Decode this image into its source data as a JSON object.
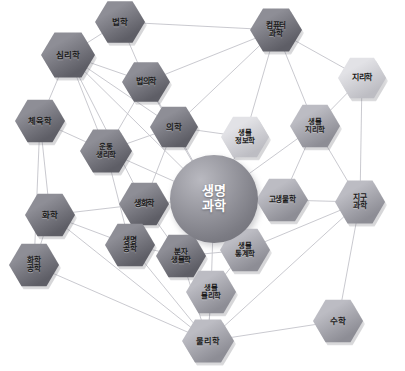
{
  "diagram": {
    "center": {
      "label_line1": "생명",
      "label_line2": "과학",
      "name": "life-science",
      "color_dark": "#7b7b83",
      "color_light": "#b9b9c0"
    },
    "caption": "",
    "palette": {
      "node_dark": "#6f6f77",
      "node_mid": "#9a9aa2",
      "node_light": "#d6d6db",
      "edge": "#c3c3c9",
      "background": "#ffffff",
      "text": "#1a1a1a",
      "center_text": "#ffffff"
    },
    "nodes": [
      {
        "id": "law",
        "lines": [
          "법학"
        ],
        "x": 120,
        "y": 22,
        "w": 50,
        "h": 44,
        "tone": "dark",
        "fs": 8.5
      },
      {
        "id": "computer-sci",
        "lines": [
          "컴퓨터",
          "과학"
        ],
        "x": 276,
        "y": 30,
        "w": 52,
        "h": 46,
        "tone": "dark",
        "fs": 7.6
      },
      {
        "id": "psychology",
        "lines": [
          "심리학"
        ],
        "x": 68,
        "y": 55,
        "w": 54,
        "h": 48,
        "tone": "dark",
        "fs": 8.5
      },
      {
        "id": "forensics",
        "lines": [
          "법의학"
        ],
        "x": 146,
        "y": 82,
        "w": 48,
        "h": 42,
        "tone": "dark",
        "fs": 8.0
      },
      {
        "id": "geography",
        "lines": [
          "지리학"
        ],
        "x": 362,
        "y": 78,
        "w": 48,
        "h": 43,
        "tone": "light",
        "fs": 8.0
      },
      {
        "id": "physical-ed",
        "lines": [
          "체육학"
        ],
        "x": 40,
        "y": 121,
        "w": 50,
        "h": 45,
        "tone": "dark",
        "fs": 8.2
      },
      {
        "id": "medicine",
        "lines": [
          "의학"
        ],
        "x": 174,
        "y": 127,
        "w": 48,
        "h": 43,
        "tone": "dark",
        "fs": 8.5
      },
      {
        "id": "bioinformatics",
        "lines": [
          "생물",
          "정보학"
        ],
        "x": 245,
        "y": 137,
        "w": 48,
        "h": 43,
        "tone": "light",
        "fs": 7.4
      },
      {
        "id": "biogeography",
        "lines": [
          "생물",
          "지리학"
        ],
        "x": 315,
        "y": 126,
        "w": 50,
        "h": 45,
        "tone": "mid",
        "fs": 7.4
      },
      {
        "id": "exercise-phys",
        "lines": [
          "운동",
          "생리학"
        ],
        "x": 106,
        "y": 151,
        "w": 52,
        "h": 46,
        "tone": "dark",
        "fs": 7.4
      },
      {
        "id": "biochemistry",
        "lines": [
          "생화학"
        ],
        "x": 144,
        "y": 204,
        "w": 50,
        "h": 45,
        "tone": "dark",
        "fs": 8.0
      },
      {
        "id": "paleontology",
        "lines": [
          "고생물학"
        ],
        "x": 282,
        "y": 200,
        "w": 52,
        "h": 45,
        "tone": "mid",
        "fs": 7.6
      },
      {
        "id": "earth-sci",
        "lines": [
          "지구",
          "과학"
        ],
        "x": 360,
        "y": 202,
        "w": 50,
        "h": 46,
        "tone": "mid",
        "fs": 7.8
      },
      {
        "id": "chemistry",
        "lines": [
          "화학"
        ],
        "x": 50,
        "y": 215,
        "w": 50,
        "h": 45,
        "tone": "dark",
        "fs": 8.5
      },
      {
        "id": "bioengineering",
        "lines": [
          "생명",
          "공학"
        ],
        "x": 130,
        "y": 245,
        "w": 50,
        "h": 45,
        "tone": "dark",
        "fs": 7.6
      },
      {
        "id": "molecular-bio",
        "lines": [
          "분자",
          "생물학"
        ],
        "x": 181,
        "y": 256,
        "w": 50,
        "h": 45,
        "tone": "dark",
        "fs": 7.4
      },
      {
        "id": "biostatistics",
        "lines": [
          "생물",
          "통계학"
        ],
        "x": 245,
        "y": 250,
        "w": 50,
        "h": 45,
        "tone": "mid",
        "fs": 7.4
      },
      {
        "id": "chem-eng",
        "lines": [
          "화학",
          "공학"
        ],
        "x": 34,
        "y": 265,
        "w": 50,
        "h": 45,
        "tone": "dark",
        "fs": 7.6
      },
      {
        "id": "biophysics",
        "lines": [
          "생물",
          "물리학"
        ],
        "x": 211,
        "y": 292,
        "w": 50,
        "h": 45,
        "tone": "mid",
        "fs": 7.4
      },
      {
        "id": "physics",
        "lines": [
          "물리학"
        ],
        "x": 208,
        "y": 341,
        "w": 52,
        "h": 46,
        "tone": "mid",
        "fs": 8.2
      },
      {
        "id": "mathematics",
        "lines": [
          "수학"
        ],
        "x": 338,
        "y": 321,
        "w": 50,
        "h": 45,
        "tone": "mid",
        "fs": 8.5
      }
    ],
    "center_pos": {
      "x": 214,
      "y": 199,
      "r": 44
    },
    "edges": [
      [
        "law",
        "psychology"
      ],
      [
        "law",
        "forensics"
      ],
      [
        "law",
        "computer-sci"
      ],
      [
        "computer-sci",
        "geography"
      ],
      [
        "computer-sci",
        "bioinformatics"
      ],
      [
        "computer-sci",
        "biogeography"
      ],
      [
        "computer-sci",
        "forensics"
      ],
      [
        "computer-sci",
        "medicine"
      ],
      [
        "psychology",
        "physical-ed"
      ],
      [
        "psychology",
        "exercise-phys"
      ],
      [
        "psychology",
        "medicine"
      ],
      [
        "psychology",
        "biochemistry"
      ],
      [
        "psychology",
        "forensics"
      ],
      [
        "psychology",
        "center"
      ],
      [
        "forensics",
        "medicine"
      ],
      [
        "forensics",
        "exercise-phys"
      ],
      [
        "forensics",
        "center"
      ],
      [
        "geography",
        "biogeography"
      ],
      [
        "geography",
        "earth-sci"
      ],
      [
        "physical-ed",
        "exercise-phys"
      ],
      [
        "physical-ed",
        "chemistry"
      ],
      [
        "physical-ed",
        "chem-eng"
      ],
      [
        "medicine",
        "center"
      ],
      [
        "medicine",
        "bioinformatics"
      ],
      [
        "medicine",
        "exercise-phys"
      ],
      [
        "medicine",
        "biochemistry"
      ],
      [
        "bioinformatics",
        "center"
      ],
      [
        "biogeography",
        "center"
      ],
      [
        "biogeography",
        "paleontology"
      ],
      [
        "biogeography",
        "earth-sci"
      ],
      [
        "exercise-phys",
        "center"
      ],
      [
        "exercise-phys",
        "bioengineering"
      ],
      [
        "biochemistry",
        "center"
      ],
      [
        "biochemistry",
        "chemistry"
      ],
      [
        "biochemistry",
        "bioengineering"
      ],
      [
        "biochemistry",
        "molecular-bio"
      ],
      [
        "paleontology",
        "center"
      ],
      [
        "paleontology",
        "earth-sci"
      ],
      [
        "earth-sci",
        "mathematics"
      ],
      [
        "earth-sci",
        "biostatistics"
      ],
      [
        "earth-sci",
        "physics"
      ],
      [
        "chemistry",
        "chem-eng"
      ],
      [
        "chemistry",
        "bioengineering"
      ],
      [
        "chemistry",
        "physics"
      ],
      [
        "bioengineering",
        "molecular-bio"
      ],
      [
        "bioengineering",
        "physics"
      ],
      [
        "molecular-bio",
        "center"
      ],
      [
        "molecular-bio",
        "biostatistics"
      ],
      [
        "molecular-bio",
        "physics"
      ],
      [
        "biostatistics",
        "center"
      ],
      [
        "biostatistics",
        "biophysics"
      ],
      [
        "chem-eng",
        "physics"
      ],
      [
        "biophysics",
        "center"
      ],
      [
        "biophysics",
        "physics"
      ],
      [
        "physics",
        "mathematics"
      ],
      [
        "physics",
        "biophysics"
      ]
    ]
  }
}
